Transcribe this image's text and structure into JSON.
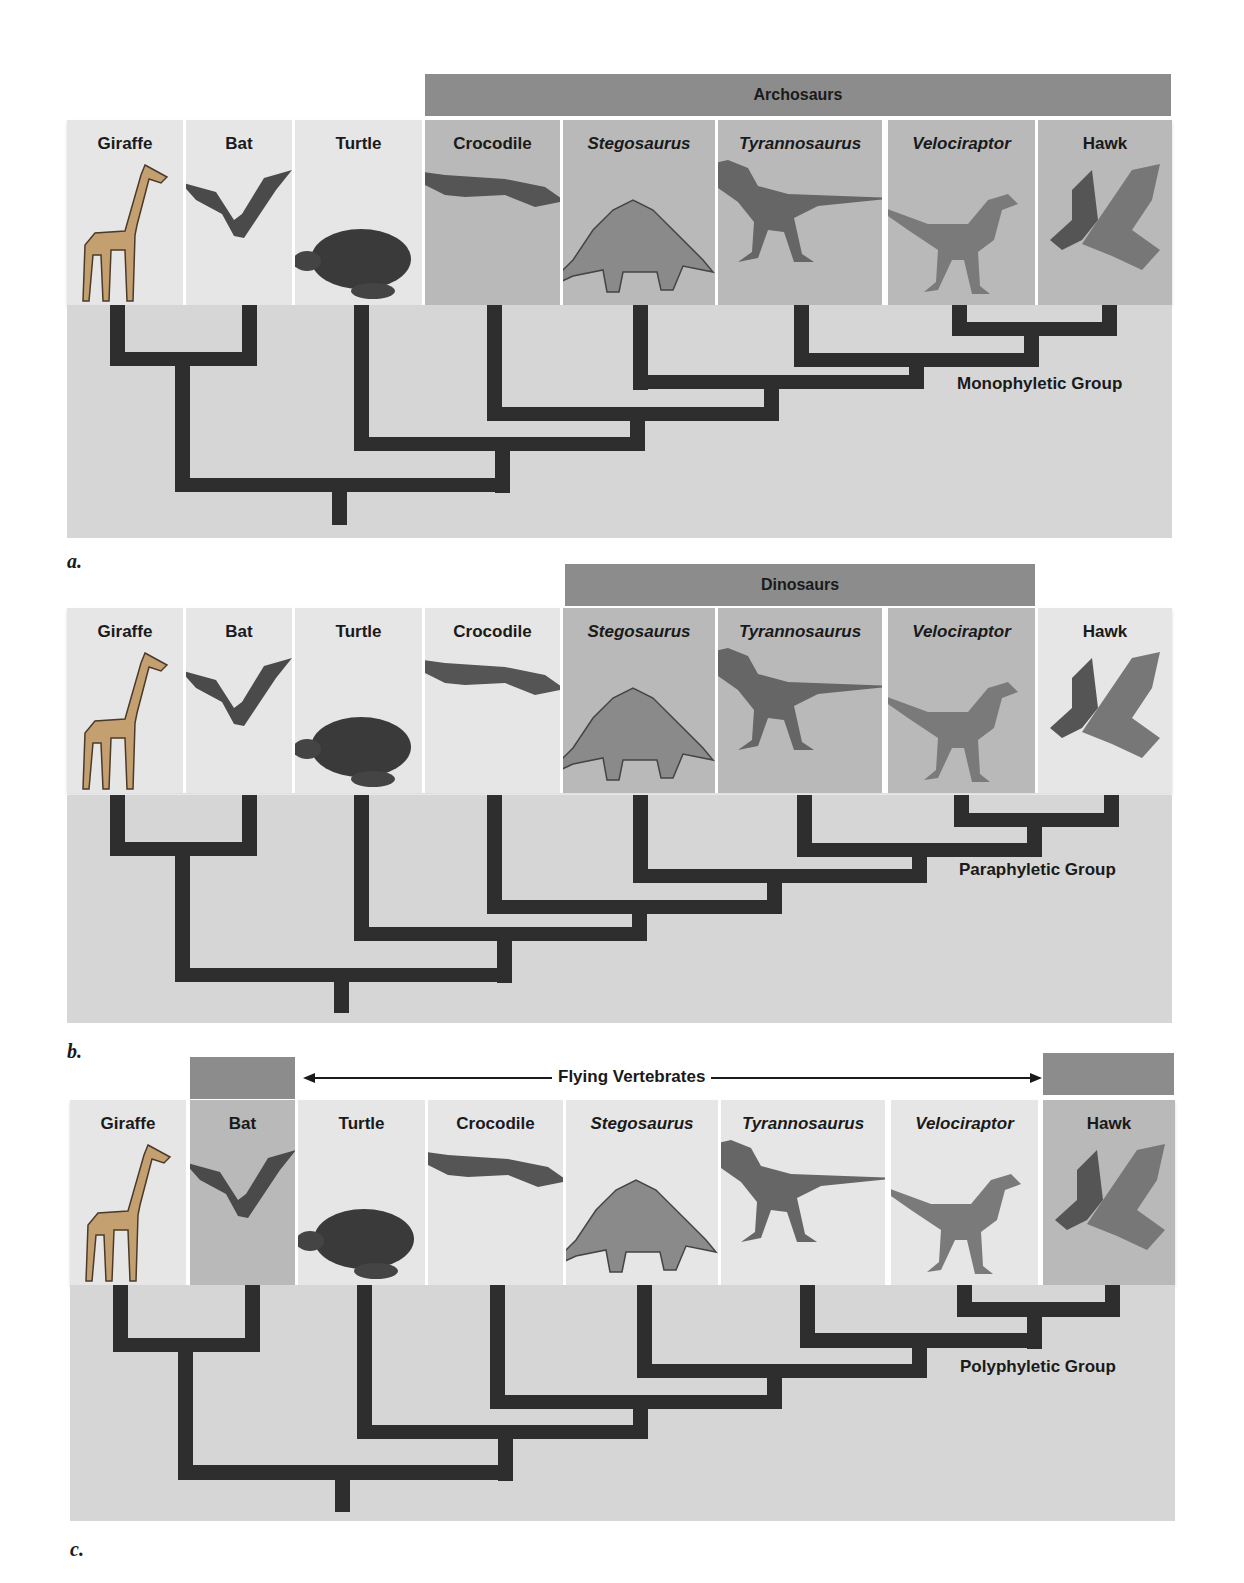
{
  "taxa": [
    {
      "name": "Giraffe",
      "italic": false,
      "icon": "giraffe-icon"
    },
    {
      "name": "Bat",
      "italic": false,
      "icon": "bat-icon"
    },
    {
      "name": "Turtle",
      "italic": false,
      "icon": "turtle-icon"
    },
    {
      "name": "Crocodile",
      "italic": false,
      "icon": "crocodile-icon"
    },
    {
      "name": "Stegosaurus",
      "italic": true,
      "icon": "stegosaurus-icon"
    },
    {
      "name": "Tyrannosaurus",
      "italic": true,
      "icon": "tyrannosaurus-icon"
    },
    {
      "name": "Velociraptor",
      "italic": true,
      "icon": "velociraptor-icon"
    },
    {
      "name": "Hawk",
      "italic": false,
      "icon": "hawk-icon"
    }
  ],
  "panels": {
    "a": {
      "letter": "a.",
      "group_bar": "Archosaurs",
      "group_type": "Monophyletic Group",
      "highlighted_taxa": [
        "Crocodile",
        "Stegosaurus",
        "Tyrannosaurus",
        "Velociraptor",
        "Hawk"
      ]
    },
    "b": {
      "letter": "b.",
      "group_bar": "Dinosaurs",
      "group_type": "Paraphyletic Group",
      "highlighted_taxa": [
        "Stegosaurus",
        "Tyrannosaurus",
        "Velociraptor"
      ]
    },
    "c": {
      "letter": "c.",
      "group_bar": "Flying Vertebrates",
      "group_type": "Polyphyletic Group",
      "highlighted_taxa": [
        "Bat",
        "Hawk"
      ]
    }
  },
  "colors": {
    "group_bar": "#8c8c8c",
    "highlight_cell": "#b9b9b9",
    "plain_cell": "#e6e6e6",
    "tree_bg": "#d6d6d6",
    "branch": "#2e2e2e"
  }
}
